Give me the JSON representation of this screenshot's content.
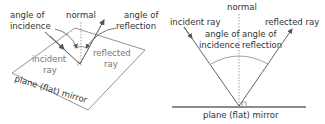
{
  "left_diagram": {
    "labels": {
      "angle_incidence_1": "angle of",
      "angle_incidence_2": "incidence",
      "normal": "normal",
      "angle_reflection_1": "angle of",
      "angle_reflection_2": "reflection",
      "incident_ray_1": "incident",
      "incident_ray_2": "ray",
      "reflected_ray_1": "reflected",
      "reflected_ray_2": "ray",
      "mirror": "plane (flat) mirror"
    }
  },
  "right_diagram": {
    "labels": {
      "normal": "normal",
      "incident_ray": "incident ray",
      "reflected_ray": "reflected ray",
      "angle_incidence_1": "angle of",
      "angle_incidence_2": "incidence",
      "angle_reflection_1": "angle of",
      "angle_reflection_2": "reflection",
      "mirror": "plane (flat) mirror"
    }
  },
  "colors": {
    "line": "#555555",
    "text": "#333333",
    "light_text": "#777777"
  }
}
